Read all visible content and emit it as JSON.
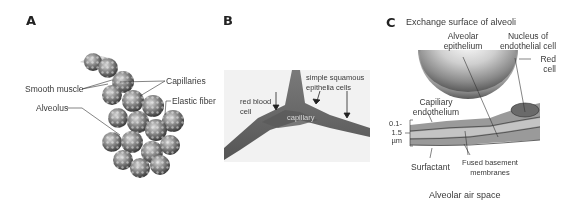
{
  "panels": {
    "a": {
      "letter": "A",
      "labels": {
        "smooth_muscle": "Smooth muscle",
        "capillaries": "Capillaries",
        "elastic_fiber": "Elastic fiber",
        "alveolus": "Alveolus"
      }
    },
    "b": {
      "letter": "B",
      "labels": {
        "red_blood_cell_1": "red blood",
        "red_blood_cell_2": "cell",
        "simple_squamous_1": "simple squamous",
        "simple_squamous_2": "epithelia cells",
        "capillary": "capillary"
      }
    },
    "c": {
      "letter": "C",
      "title": "Exchange surface of alveoli",
      "labels": {
        "alveolar_epithelium_1": "Alveolar",
        "alveolar_epithelium_2": "epithelium",
        "nucleus_1": "Nucleus of",
        "nucleus_2": "endothelial cell",
        "red_cell_1": "Red",
        "red_cell_2": "cell",
        "capillary_endothelium_1": "Capiliary",
        "capillary_endothelium_2": "endothelium",
        "thickness_1": "0.1-",
        "thickness_2": "1.5",
        "thickness_3": "µm",
        "surfactant": "Surfactant",
        "fused_1": "Fused basement",
        "fused_2": "membranes",
        "air_space": "Alveolar air space"
      }
    }
  },
  "colors": {
    "text": "#3a3a3a",
    "line": "#333333",
    "alveoli_dark": "#4a4a4a",
    "alveoli_light": "#bdbdbd",
    "tissue": "#6b6b6b",
    "background": "#ffffff"
  }
}
